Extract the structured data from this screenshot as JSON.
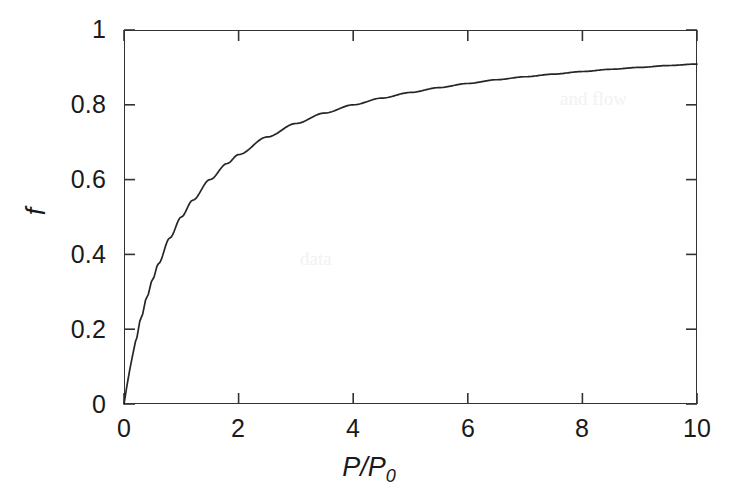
{
  "figure": {
    "background_color": "#ffffff",
    "axis_color": "#333333",
    "curve_color": "#262626",
    "text_color": "#1a1a1a"
  },
  "axes": {
    "x_label_main": "P",
    "x_label_slash": "/",
    "x_label_sym": "P",
    "x_label_sub": "0",
    "y_label": "f"
  },
  "ticks": {
    "x": [
      "0",
      "2",
      "4",
      "6",
      "8",
      "10"
    ],
    "y": [
      "0",
      "0.2",
      "0.4",
      "0.6",
      "0.8",
      "1"
    ]
  },
  "ghost_artifacts": [
    {
      "text": "and flow",
      "x": 560,
      "y": 90
    },
    {
      "text": "data",
      "x": 300,
      "y": 250
    }
  ],
  "chart_data": {
    "type": "line",
    "title": "",
    "xlabel": "P/P0",
    "ylabel": "f",
    "xlim": [
      0,
      10
    ],
    "ylim": [
      0,
      1
    ],
    "xticks": [
      0,
      2,
      4,
      6,
      8,
      10
    ],
    "yticks": [
      0,
      0.2,
      0.4,
      0.6,
      0.8,
      1
    ],
    "grid": false,
    "legend": false,
    "tick_direction": "in",
    "frame": "box",
    "equation": "f = (P/P0) / (1 + P/P0)",
    "series": [
      {
        "name": "f",
        "x": [
          0,
          0.05,
          0.1,
          0.15,
          0.2,
          0.3,
          0.4,
          0.5,
          0.6,
          0.8,
          1.0,
          1.2,
          1.5,
          1.8,
          2.0,
          2.5,
          3.0,
          3.5,
          4.0,
          4.5,
          5.0,
          5.5,
          6.0,
          6.5,
          7.0,
          7.5,
          8.0,
          8.5,
          9.0,
          9.5,
          10.0
        ],
        "y": [
          0.0,
          0.048,
          0.091,
          0.13,
          0.167,
          0.231,
          0.286,
          0.333,
          0.375,
          0.444,
          0.5,
          0.545,
          0.6,
          0.643,
          0.667,
          0.714,
          0.75,
          0.778,
          0.8,
          0.818,
          0.833,
          0.846,
          0.857,
          0.867,
          0.875,
          0.882,
          0.889,
          0.895,
          0.9,
          0.905,
          0.909
        ]
      }
    ]
  }
}
